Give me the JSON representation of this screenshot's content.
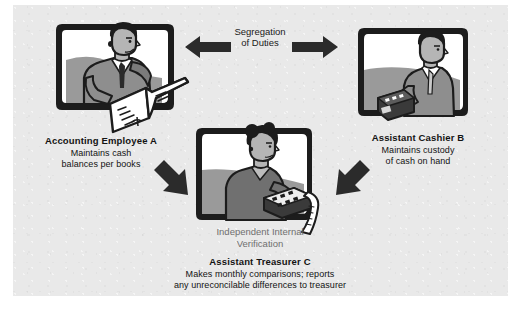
{
  "diagram": {
    "background_color": "#e9e9e9",
    "page_color": "#ffffff",
    "arrow_color": "#2b2b2b",
    "text_color": "#131313",
    "muted_text_color": "#6f6f6f"
  },
  "relations": {
    "segregation": {
      "line1": "Segregation",
      "line2": "of Duties"
    },
    "verification": {
      "line1": "Independent Internal",
      "line2": "Verification"
    }
  },
  "nodes": {
    "employee_a": {
      "title": "Accounting Employee A",
      "desc_line1": "Maintains cash",
      "desc_line2": "balances per books",
      "illustration": "person-with-ledger-book"
    },
    "cashier_b": {
      "title": "Assistant Cashier B",
      "desc_line1": "Maintains custody",
      "desc_line2": "of cash on hand",
      "illustration": "person-at-cash-register"
    },
    "treasurer_c": {
      "title": "Assistant Treasurer C",
      "desc_line1": "Makes monthly comparisons; reports",
      "desc_line2": "any unreconcilable differences to treasurer",
      "illustration": "person-with-calculator-tape"
    }
  },
  "arrows": {
    "left_arrow": "arrow-left-icon",
    "right_arrow": "arrow-right-icon",
    "down_right_arrow": "arrow-down-right-icon",
    "down_left_arrow": "arrow-down-left-icon"
  }
}
